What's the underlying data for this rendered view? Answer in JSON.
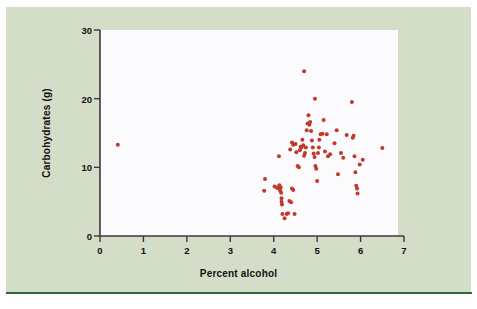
{
  "figure": {
    "panel_color": "#d4ddc8",
    "canvas_color": "#fbfbfd",
    "rule_color": "#2f6b2f",
    "axis_color": "#3a3a3a"
  },
  "chart_data": {
    "type": "scatter",
    "title": "",
    "xlabel": "Percent alcohol",
    "ylabel": "Carbohydrates (g)",
    "xlim": [
      0,
      7
    ],
    "ylim": [
      0,
      30
    ],
    "xticks": [
      0,
      1,
      2,
      3,
      4,
      5,
      6,
      7
    ],
    "xtick_labels": [
      "0",
      "1",
      "2",
      "3",
      "4",
      "5",
      "6",
      "7"
    ],
    "yticks": [
      0,
      10,
      20,
      30
    ],
    "ytick_labels": [
      "0",
      "10",
      "20",
      "30"
    ],
    "grid": false,
    "legend": null,
    "marker_color": "#c0392b",
    "marker_size": 4,
    "points": [
      [
        0.41,
        13.3
      ],
      [
        3.8,
        8.3
      ],
      [
        3.78,
        6.6
      ],
      [
        4.02,
        7.2
      ],
      [
        4.08,
        7.0
      ],
      [
        4.13,
        7.4
      ],
      [
        4.14,
        6.9
      ],
      [
        4.15,
        6.6
      ],
      [
        4.16,
        7.1
      ],
      [
        4.17,
        6.3
      ],
      [
        4.18,
        5.5
      ],
      [
        4.18,
        5.0
      ],
      [
        4.19,
        4.6
      ],
      [
        4.12,
        11.6
      ],
      [
        4.2,
        3.2
      ],
      [
        4.25,
        2.6
      ],
      [
        4.3,
        3.2
      ],
      [
        4.33,
        3.3
      ],
      [
        4.36,
        5.1
      ],
      [
        4.4,
        4.9
      ],
      [
        4.42,
        6.9
      ],
      [
        4.45,
        6.7
      ],
      [
        4.48,
        3.2
      ],
      [
        4.38,
        12.6
      ],
      [
        4.42,
        13.6
      ],
      [
        4.45,
        13.3
      ],
      [
        4.5,
        13.4
      ],
      [
        4.52,
        12.2
      ],
      [
        4.55,
        10.2
      ],
      [
        4.58,
        10.0
      ],
      [
        4.6,
        12.5
      ],
      [
        4.62,
        13.0
      ],
      [
        4.64,
        12.9
      ],
      [
        4.66,
        14.0
      ],
      [
        4.68,
        13.2
      ],
      [
        4.7,
        11.7
      ],
      [
        4.72,
        12.1
      ],
      [
        4.74,
        12.9
      ],
      [
        4.7,
        24.0
      ],
      [
        4.76,
        15.4
      ],
      [
        4.78,
        16.4
      ],
      [
        4.8,
        17.6
      ],
      [
        4.82,
        16.2
      ],
      [
        4.84,
        16.6
      ],
      [
        4.86,
        15.3
      ],
      [
        4.88,
        13.9
      ],
      [
        4.9,
        12.9
      ],
      [
        4.92,
        12.0
      ],
      [
        4.94,
        11.5
      ],
      [
        4.96,
        10.2
      ],
      [
        4.95,
        20.0
      ],
      [
        4.98,
        9.8
      ],
      [
        5.0,
        8.0
      ],
      [
        5.02,
        12.1
      ],
      [
        5.04,
        12.9
      ],
      [
        5.05,
        14.0
      ],
      [
        5.08,
        14.8
      ],
      [
        5.12,
        14.9
      ],
      [
        5.15,
        16.9
      ],
      [
        5.18,
        12.3
      ],
      [
        5.22,
        14.8
      ],
      [
        5.25,
        11.6
      ],
      [
        5.3,
        11.9
      ],
      [
        5.4,
        13.5
      ],
      [
        5.45,
        15.4
      ],
      [
        5.48,
        9.0
      ],
      [
        5.55,
        12.1
      ],
      [
        5.6,
        11.4
      ],
      [
        5.68,
        14.7
      ],
      [
        5.8,
        19.5
      ],
      [
        5.82,
        14.3
      ],
      [
        5.84,
        14.6
      ],
      [
        5.86,
        11.6
      ],
      [
        5.88,
        9.3
      ],
      [
        5.9,
        7.3
      ],
      [
        5.92,
        6.9
      ],
      [
        5.93,
        6.2
      ],
      [
        5.98,
        10.4
      ],
      [
        6.05,
        11.1
      ],
      [
        6.5,
        12.8
      ]
    ]
  }
}
